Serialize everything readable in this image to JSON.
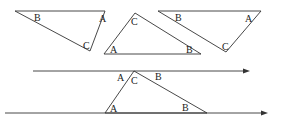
{
  "diagram": {
    "colors": {
      "stroke": "#333333",
      "text": "#222222",
      "background": "#ffffff"
    },
    "top_triangles": [
      {
        "points": [
          [
            15,
            11
          ],
          [
            105,
            11
          ],
          [
            90,
            51
          ]
        ],
        "labels": [
          {
            "text": "B",
            "x": 34,
            "y": 21
          },
          {
            "text": "A",
            "x": 99,
            "y": 22
          },
          {
            "text": "C",
            "x": 83,
            "y": 49
          }
        ]
      },
      {
        "points": [
          [
            135,
            13
          ],
          [
            104,
            54
          ],
          [
            201,
            54
          ]
        ],
        "labels": [
          {
            "text": "C",
            "x": 131,
            "y": 25
          },
          {
            "text": "A",
            "x": 110,
            "y": 53
          },
          {
            "text": "B",
            "x": 186,
            "y": 53
          }
        ]
      },
      {
        "points": [
          [
            158,
            11
          ],
          [
            261,
            11
          ],
          [
            226,
            52
          ]
        ],
        "labels": [
          {
            "text": "B",
            "x": 175,
            "y": 21
          },
          {
            "text": "A",
            "x": 245,
            "y": 22
          },
          {
            "text": "C",
            "x": 222,
            "y": 50
          }
        ]
      }
    ],
    "parallel_lines": [
      {
        "x1": 33,
        "y1": 71,
        "x2": 250,
        "y2": 71
      },
      {
        "x1": 5,
        "y1": 113,
        "x2": 268,
        "y2": 113
      }
    ],
    "bottom_triangle": {
      "points": [
        [
          134,
          71
        ],
        [
          105,
          113
        ],
        [
          207,
          113
        ]
      ],
      "labels": [
        {
          "text": "A",
          "x": 117,
          "y": 81
        },
        {
          "text": "C",
          "x": 131,
          "y": 84
        },
        {
          "text": "B",
          "x": 155,
          "y": 80
        },
        {
          "text": "A",
          "x": 110,
          "y": 112
        },
        {
          "text": "B",
          "x": 182,
          "y": 111
        }
      ]
    }
  }
}
